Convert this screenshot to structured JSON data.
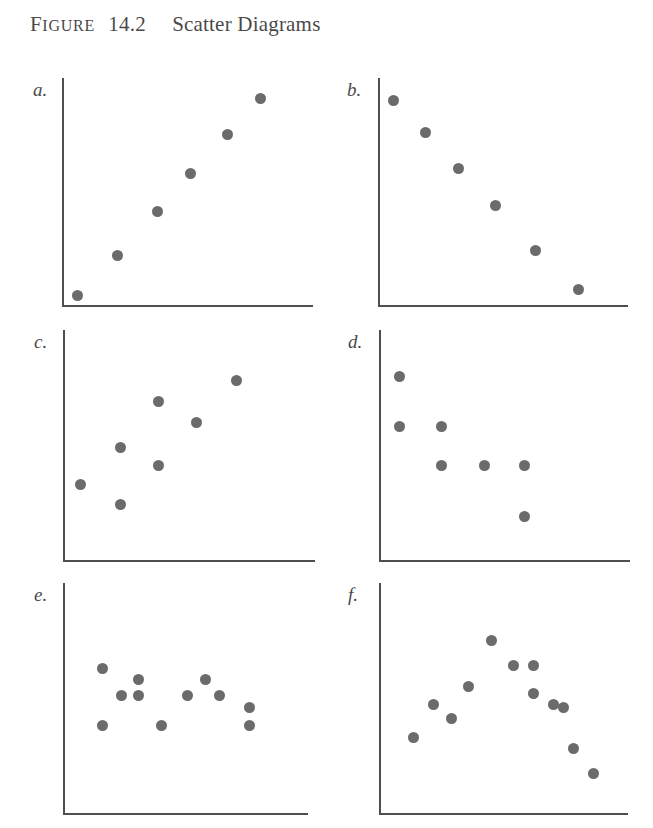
{
  "figure": {
    "label_prefix_cap": "F",
    "label_prefix_rest": "IGURE",
    "number": "14.2",
    "name": "Scatter Diagrams",
    "point_color": "#6b6b6b",
    "axis_color": "#4f4f4f"
  },
  "chart_data": [
    {
      "id": "a",
      "panel_label": "a.",
      "type": "scatter",
      "title": "",
      "xlabel": "",
      "ylabel": "",
      "relationship": "strong positive linear",
      "xlim": [
        0,
        100
      ],
      "ylim": [
        0,
        100
      ],
      "grid": false,
      "legend": "none",
      "n_points": 6,
      "x": [
        6,
        22,
        38,
        51,
        66,
        79
      ],
      "y": [
        4,
        22,
        41,
        58,
        75,
        91
      ]
    },
    {
      "id": "b",
      "panel_label": "b.",
      "type": "scatter",
      "title": "",
      "xlabel": "",
      "ylabel": "",
      "relationship": "strong negative linear",
      "xlim": [
        0,
        100
      ],
      "ylim": [
        0,
        100
      ],
      "grid": false,
      "legend": "none",
      "n_points": 6,
      "x": [
        6,
        19,
        32,
        47,
        63,
        80
      ],
      "y": [
        90,
        76,
        60,
        44,
        24,
        7
      ]
    },
    {
      "id": "c",
      "panel_label": "c.",
      "type": "scatter",
      "title": "",
      "xlabel": "",
      "ylabel": "",
      "relationship": "weak positive",
      "xlim": [
        0,
        100
      ],
      "ylim": [
        0,
        100
      ],
      "grid": false,
      "legend": "none",
      "n_points": 7,
      "x": [
        7,
        23,
        23,
        38,
        38,
        53,
        69
      ],
      "y": [
        33,
        49,
        24,
        69,
        41,
        60,
        78
      ]
    },
    {
      "id": "d",
      "panel_label": "d.",
      "type": "scatter",
      "title": "",
      "xlabel": "",
      "ylabel": "",
      "relationship": "weak negative",
      "xlim": [
        0,
        100
      ],
      "ylim": [
        0,
        100
      ],
      "grid": false,
      "legend": "none",
      "n_points": 7,
      "x": [
        8,
        8,
        25,
        25,
        42,
        58,
        58
      ],
      "y": [
        80,
        58,
        58,
        41,
        41,
        41,
        19
      ]
    },
    {
      "id": "e",
      "panel_label": "e.",
      "type": "scatter",
      "title": "",
      "xlabel": "",
      "ylabel": "",
      "relationship": "no correlation",
      "xlim": [
        0,
        100
      ],
      "ylim": [
        0,
        100
      ],
      "grid": false,
      "legend": "none",
      "n_points": 11,
      "x": [
        16,
        16,
        24,
        31,
        31,
        40,
        51,
        58,
        64,
        76,
        76
      ],
      "y": [
        63,
        38,
        51,
        58,
        51,
        38,
        51,
        58,
        51,
        46,
        38
      ]
    },
    {
      "id": "f",
      "panel_label": "f.",
      "type": "scatter",
      "title": "",
      "xlabel": "",
      "ylabel": "",
      "relationship": "curvilinear (inverted U)",
      "xlim": [
        0,
        100
      ],
      "ylim": [
        0,
        100
      ],
      "grid": false,
      "legend": "none",
      "n_points": 12,
      "x": [
        14,
        22,
        29,
        36,
        45,
        54,
        62,
        62,
        70,
        74,
        78,
        86
      ],
      "y": [
        33,
        47,
        41,
        55,
        75,
        64,
        64,
        52,
        47,
        46,
        28,
        17
      ]
    }
  ]
}
